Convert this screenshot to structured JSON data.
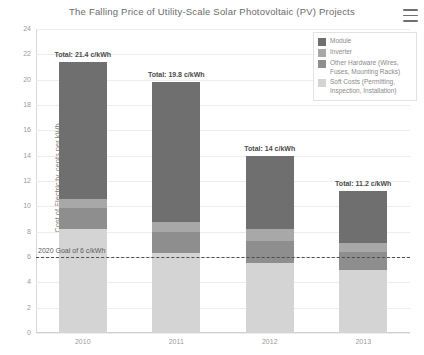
{
  "header": {
    "title": "The Falling Price of Utility-Scale Solar Photovoltaic (PV) Projects",
    "menu_icon": "hamburger-menu-icon"
  },
  "legend": {
    "position": "top-right",
    "items": [
      {
        "label": "Module",
        "color": "#6f6f6f"
      },
      {
        "label": "Inverter",
        "color": "#a8a8a8"
      },
      {
        "label": "Other Hardware (Wires, Fuses, Mounting Racks)",
        "color": "#8e8e8e"
      },
      {
        "label": "Soft Costs (Permitting, Inspection, Installation)",
        "color": "#d4d4d4"
      }
    ]
  },
  "annotation": {
    "goal_label": "2020 Goal of 6 c/kWh",
    "goal_value": 6
  },
  "chart_data": {
    "type": "bar",
    "stacked": true,
    "title": "The Falling Price of Utility-Scale Solar Photovoltaic (PV) Projects",
    "xlabel": "",
    "ylabel": "Cost of Electricity, cents per kWh",
    "categories": [
      "2010",
      "2011",
      "2012",
      "2013"
    ],
    "ylim": [
      0,
      24
    ],
    "yticks": [
      0,
      2,
      4,
      6,
      8,
      10,
      12,
      14,
      16,
      18,
      20,
      22,
      24
    ],
    "grid": true,
    "series": [
      {
        "name": "Soft Costs (Permitting, Inspection, Installation)",
        "color": "#d4d4d4",
        "values": [
          8.2,
          6.3,
          5.5,
          5.0
        ]
      },
      {
        "name": "Other Hardware (Wires, Fuses, Mounting Racks)",
        "color": "#8e8e8e",
        "values": [
          1.7,
          1.7,
          1.8,
          1.4
        ]
      },
      {
        "name": "Inverter",
        "color": "#a8a8a8",
        "values": [
          0.7,
          0.8,
          0.9,
          0.7
        ]
      },
      {
        "name": "Module",
        "color": "#6f6f6f",
        "values": [
          10.8,
          11.0,
          5.8,
          4.1
        ]
      }
    ],
    "totals": [
      21.4,
      19.8,
      14.0,
      11.2
    ],
    "total_labels": [
      "Total: 21.4 c/kWh",
      "Total: 19.8 c/kWh",
      "Total: 14 c/kWh",
      "Total: 11.2 c/kWh"
    ],
    "reference_line": {
      "value": 6,
      "label": "2020 Goal of 6 c/kWh",
      "style": "dashed"
    }
  }
}
